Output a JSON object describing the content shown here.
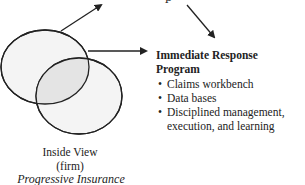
{
  "diagram": {
    "program": {
      "title": "Immediate Response Program",
      "title_line1": "Immediate Response",
      "title_line2": "Program",
      "bullets": [
        "Claims workbench",
        "Data bases",
        "Disciplined management,",
        "execution, and learning"
      ],
      "bullet_glyph": "•"
    },
    "inside_view": {
      "label": "Inside View",
      "sublabel": "(firm)",
      "company": "Progressive Insurance"
    },
    "colors": {
      "stroke": "#222222",
      "text": "#222222",
      "circle_fill": "#f3f3f3",
      "overlap_fill": "#e6e6e6"
    }
  }
}
